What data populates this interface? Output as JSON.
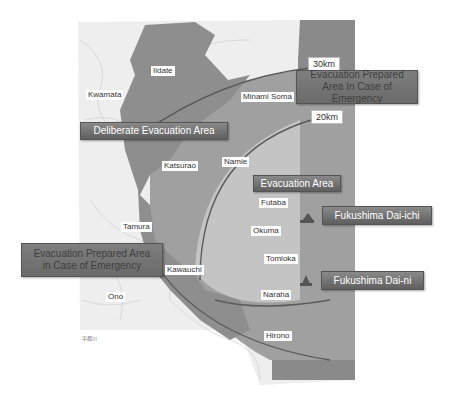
{
  "map": {
    "colors": {
      "background": "#ffffff",
      "base_map": "#eeeeee",
      "deliberate_zone": "#8e8e8e",
      "prepared_zone": "#a8a8a8",
      "evacuation_zone": "#c4c4c4",
      "sea_band": "#8a8a8a",
      "arc_line": "#5a5a5a",
      "banner": "#6e6e6e"
    },
    "radius_labels": {
      "r30": "30km",
      "r20": "20km"
    },
    "banners": {
      "deliberate": "Deliberate Evacuation Area",
      "prepared_ne": "Evacuation Prepared Area In Case of Emergency",
      "prepared_w": "Evacuation Prepared Area in Case of Emergency",
      "evacuation": "Evacuation Area",
      "daiichi": "Fukushima Dai-ichi",
      "daini": "Fukushima Dai-ni"
    },
    "places": {
      "iidate": "Iidate",
      "kwamata": "Kwamata",
      "minami_soma": "Minami Soma",
      "katsurao": "Katsurao",
      "namie": "Namie",
      "futaba": "Futaba",
      "tamura": "Tamura",
      "okuma": "Okuma",
      "tomioka": "Tomioka",
      "kawauchi": "Kawauchi",
      "ono": "Ono",
      "naraha": "Naraha",
      "hirono": "Hirono"
    },
    "attribution": "宇都川"
  }
}
